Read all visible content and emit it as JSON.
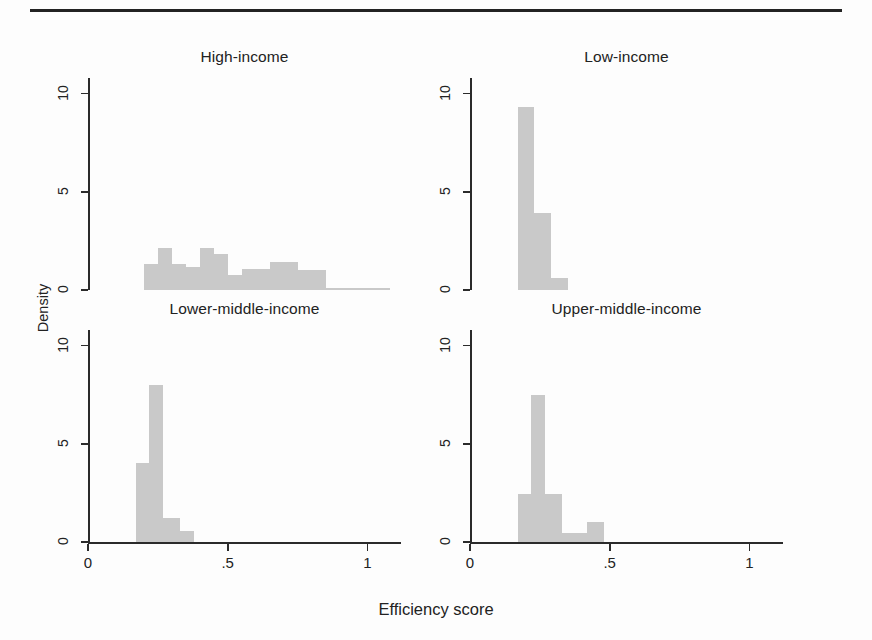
{
  "figure": {
    "xlabel": "Efficiency score",
    "ylabel": "Density"
  },
  "chart_data": {
    "type": "bar",
    "title": "",
    "subtitle": "",
    "xlabel": "Efficiency score",
    "ylabel": "Density",
    "xlim": [
      0,
      1.12
    ],
    "ylim": [
      0,
      10.8
    ],
    "xticks": [
      "0",
      ".5",
      "1"
    ],
    "xtick_values": [
      0,
      0.5,
      1
    ],
    "yticks": [
      "0",
      "5",
      "10"
    ],
    "ytick_values": [
      0,
      5,
      10
    ],
    "grid": false,
    "legend": "none",
    "layout": "2x2 small-multiples (histogram density by income group)",
    "panels": [
      {
        "name": "high-income",
        "title": "High-income",
        "position": "top-left",
        "bin_width": 0.05,
        "bins": [
          {
            "x0": 0.2,
            "x1": 0.25,
            "density": 1.3
          },
          {
            "x0": 0.25,
            "x1": 0.3,
            "density": 2.15
          },
          {
            "x0": 0.3,
            "x1": 0.35,
            "density": 1.3
          },
          {
            "x0": 0.35,
            "x1": 0.4,
            "density": 1.15
          },
          {
            "x0": 0.4,
            "x1": 0.45,
            "density": 2.15
          },
          {
            "x0": 0.45,
            "x1": 0.5,
            "density": 1.85
          },
          {
            "x0": 0.5,
            "x1": 0.55,
            "density": 0.75
          },
          {
            "x0": 0.55,
            "x1": 0.6,
            "density": 1.05
          },
          {
            "x0": 0.6,
            "x1": 0.65,
            "density": 1.05
          },
          {
            "x0": 0.65,
            "x1": 0.7,
            "density": 1.45
          },
          {
            "x0": 0.7,
            "x1": 0.75,
            "density": 1.45
          },
          {
            "x0": 0.75,
            "x1": 0.8,
            "density": 1.0
          },
          {
            "x0": 0.8,
            "x1": 0.85,
            "density": 1.0
          },
          {
            "x0": 0.85,
            "x1": 1.08,
            "density": 0.1
          }
        ]
      },
      {
        "name": "low-income",
        "title": "Low-income",
        "position": "top-right",
        "bin_width": 0.05,
        "bins": [
          {
            "x0": 0.17,
            "x1": 0.23,
            "density": 9.3
          },
          {
            "x0": 0.23,
            "x1": 0.29,
            "density": 3.9
          },
          {
            "x0": 0.29,
            "x1": 0.35,
            "density": 0.6
          }
        ]
      },
      {
        "name": "lower-middle-income",
        "title": "Lower-middle-income",
        "position": "bottom-left",
        "bin_width": 0.05,
        "bins": [
          {
            "x0": 0.17,
            "x1": 0.22,
            "density": 4.0
          },
          {
            "x0": 0.22,
            "x1": 0.27,
            "density": 8.0
          },
          {
            "x0": 0.27,
            "x1": 0.33,
            "density": 1.2
          },
          {
            "x0": 0.33,
            "x1": 0.38,
            "density": 0.55
          }
        ]
      },
      {
        "name": "upper-middle-income",
        "title": "Upper-middle-income",
        "position": "bottom-right",
        "bin_width": 0.05,
        "bins": [
          {
            "x0": 0.17,
            "x1": 0.22,
            "density": 2.45
          },
          {
            "x0": 0.22,
            "x1": 0.27,
            "density": 7.5
          },
          {
            "x0": 0.27,
            "x1": 0.33,
            "density": 2.45
          },
          {
            "x0": 0.33,
            "x1": 0.42,
            "density": 0.45
          },
          {
            "x0": 0.42,
            "x1": 0.48,
            "density": 1.0
          }
        ]
      }
    ]
  }
}
